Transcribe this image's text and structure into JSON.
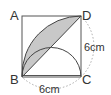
{
  "diagram": {
    "type": "geometry",
    "shape": "square ABCD with quarter-circle arc, semicircle and diagonal",
    "vertices": {
      "A": "A",
      "B": "B",
      "C": "C",
      "D": "D"
    },
    "dimensions": {
      "side_right": "6cm",
      "side_bottom": "6cm"
    },
    "colors": {
      "stroke": "#444444",
      "shade": "#c8c8c8",
      "dotted": "#aaaaaa"
    }
  }
}
